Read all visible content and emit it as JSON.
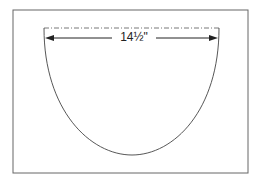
{
  "diagram": {
    "dimension_label": "14½\"",
    "shape": "semicircular pattern piece",
    "colors": {
      "line": "#444444",
      "frame": "#666666",
      "background": "#ffffff"
    }
  }
}
